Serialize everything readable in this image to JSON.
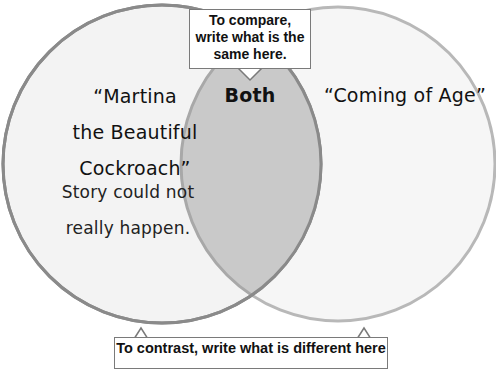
{
  "diagram": {
    "type": "venn",
    "left_circle": {
      "title_lines": [
        "“Martina",
        "the Beautiful",
        "Cockroach”"
      ],
      "note_lines": [
        "Story could not",
        "really happen."
      ],
      "stroke_color": "#8a8a8a",
      "fill_color": "#f4f4f4"
    },
    "right_circle": {
      "title": "“Coming of Age”",
      "stroke_color": "#b8b8b8",
      "fill_color": "#f6f6f6"
    },
    "overlap": {
      "label": "Both",
      "fill_color": "#c9c9c9"
    },
    "callout_top": {
      "lines": [
        "To compare,",
        "write what is the",
        "same here."
      ]
    },
    "callout_bottom": {
      "text": "To contrast, write what is different here"
    }
  }
}
